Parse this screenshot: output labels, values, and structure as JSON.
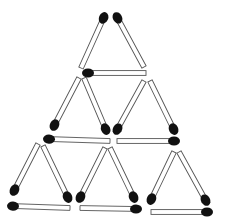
{
  "puzzle": {
    "type": "matchstick-triangles",
    "triangle_count": 6,
    "match_count": 18,
    "colors": {
      "background": "#ffffff",
      "stick": "#ffffff",
      "outline": "#555555",
      "head": "#111111"
    },
    "matches": [
      {
        "id": 1,
        "head": [
          104,
          17
        ],
        "tail": [
          81,
          68
        ]
      },
      {
        "id": 2,
        "head": [
          117,
          17
        ],
        "tail": [
          144,
          67
        ]
      },
      {
        "id": 3,
        "head": [
          87,
          73
        ],
        "tail": [
          146,
          73
        ]
      },
      {
        "id": 4,
        "head": [
          54,
          126
        ],
        "tail": [
          79,
          78
        ]
      },
      {
        "id": 5,
        "head": [
          106,
          130
        ],
        "tail": [
          84,
          78
        ]
      },
      {
        "id": 6,
        "head": [
          48,
          139
        ],
        "tail": [
          110,
          141
        ]
      },
      {
        "id": 7,
        "head": [
          117,
          130
        ],
        "tail": [
          144,
          81
        ]
      },
      {
        "id": 8,
        "head": [
          174,
          130
        ],
        "tail": [
          150,
          81
        ]
      },
      {
        "id": 9,
        "head": [
          175,
          141
        ],
        "tail": [
          117,
          141
        ]
      },
      {
        "id": 10,
        "head": [
          14,
          191
        ],
        "tail": [
          38,
          144
        ]
      },
      {
        "id": 11,
        "head": [
          68,
          198
        ],
        "tail": [
          43,
          146
        ]
      },
      {
        "id": 12,
        "head": [
          12,
          206
        ],
        "tail": [
          70,
          208
        ]
      },
      {
        "id": 13,
        "head": [
          80,
          198
        ],
        "tail": [
          105,
          148
        ]
      },
      {
        "id": 14,
        "head": [
          134,
          198
        ],
        "tail": [
          110,
          148
        ]
      },
      {
        "id": 15,
        "head": [
          137,
          209
        ],
        "tail": [
          80,
          208
        ]
      },
      {
        "id": 16,
        "head": [
          151,
          200
        ],
        "tail": [
          174,
          152
        ]
      },
      {
        "id": 17,
        "head": [
          206,
          201
        ],
        "tail": [
          179,
          152
        ]
      },
      {
        "id": 18,
        "head": [
          208,
          212
        ],
        "tail": [
          151,
          212
        ]
      }
    ]
  }
}
